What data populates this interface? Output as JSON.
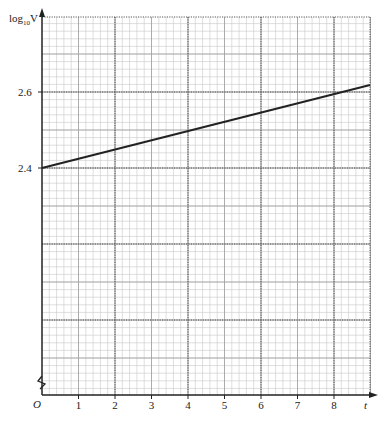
{
  "chart_data": {
    "type": "line",
    "title": "",
    "xlabel": "t",
    "ylabel": "log10 V",
    "x_ticks": [
      "1",
      "2",
      "3",
      "4",
      "5",
      "6",
      "7",
      "8"
    ],
    "y_ticks": [
      "2.4",
      "2.6"
    ],
    "origin_label": "O",
    "axis_break": true,
    "grid": true,
    "xlim": [
      0,
      9
    ],
    "ylim": [
      2.4,
      2.65
    ],
    "series": [
      {
        "name": "log10 V vs t",
        "x": [
          0,
          8,
          9
        ],
        "y": [
          2.4,
          2.6,
          2.625
        ]
      }
    ]
  },
  "labels": {
    "y_axis_main": "log",
    "y_axis_sub": "10",
    "y_axis_var": "V",
    "x_axis": "t",
    "origin": "O",
    "x_ticks": [
      "1",
      "2",
      "3",
      "4",
      "5",
      "6",
      "7",
      "8"
    ],
    "y_tick_24": "2.4",
    "y_tick_26": "2.6"
  }
}
